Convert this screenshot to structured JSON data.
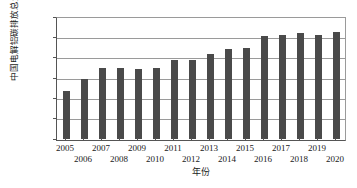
{
  "chart_data": {
    "type": "bar",
    "title": "",
    "xlabel": "年份",
    "ylabel": "中国电解铝碳排放总量/10",
    "ylabel_exponent": "4",
    "ylabel_unit_tail": "t",
    "categories": [
      "2005",
      "2006",
      "2007",
      "2008",
      "2009",
      "2010",
      "2011",
      "2012",
      "2013",
      "2014",
      "2015",
      "2016",
      "2017",
      "2018",
      "2019",
      "2020"
    ],
    "values": [
      480,
      598,
      710,
      713,
      703,
      706,
      788,
      795,
      853,
      903,
      910,
      1027,
      1042,
      1057,
      1045,
      1068
    ],
    "ylim": [
      0,
      1200
    ],
    "yticks": [
      0,
      200,
      400,
      600,
      800,
      1000,
      1200
    ],
    "ytick_labels": [
      "0",
      "200",
      "400",
      "600",
      "800",
      "1000",
      "1200"
    ],
    "grid": true,
    "grid_axis": "y",
    "legend": false,
    "bar_color": "#4a4a4a",
    "axis_color": "#555555",
    "grid_color": "#9a9a9a",
    "background": "#ffffff",
    "xtick_stagger": true
  }
}
